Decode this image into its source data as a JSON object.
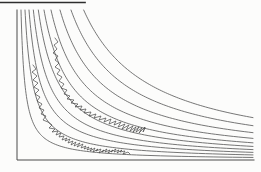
{
  "figure": {
    "background_color": "#fcfcfb",
    "curve_color": "#5d5d5d",
    "axis_color": "#4a4a4a",
    "trace_color": "#454545",
    "rule_color": "#2e2e2e"
  },
  "chart_data": {
    "type": "line",
    "title": "",
    "xlabel": "",
    "ylabel": "",
    "grid": false,
    "legend": null,
    "plot_box_px": {
      "left": 17,
      "top": 10,
      "right": 253,
      "bottom": 160
    },
    "top_rule_px": {
      "x1": 0,
      "y": 2.5,
      "x2": 85
    },
    "axis_ranges_units": {
      "x": [
        0,
        236
      ],
      "y": [
        0,
        150
      ]
    },
    "hyperbolas": {
      "model": "y = k / x in plot units (origin at axes corner, y upward), clipped to y <= 150 and x <= 236",
      "k_values": [
        600,
        1200,
        1800,
        2450,
        3200,
        4050,
        5100,
        6450,
        8100,
        10000
      ]
    },
    "series": [
      {
        "name": "random-walk-upper",
        "points": [
          [
            38,
            122
          ],
          [
            41,
            118
          ],
          [
            37,
            115
          ],
          [
            40,
            111
          ],
          [
            36,
            107
          ],
          [
            41,
            104
          ],
          [
            38,
            100
          ],
          [
            42,
            97
          ],
          [
            38,
            93
          ],
          [
            43,
            90
          ],
          [
            40,
            86
          ],
          [
            45,
            83
          ],
          [
            42,
            79
          ],
          [
            47,
            76
          ],
          [
            44,
            72
          ],
          [
            50,
            70
          ],
          [
            47,
            66
          ],
          [
            53,
            64
          ],
          [
            50,
            61
          ],
          [
            57,
            60
          ],
          [
            54,
            57
          ],
          [
            61,
            56
          ],
          [
            58,
            53
          ],
          [
            65,
            54
          ],
          [
            63,
            50
          ],
          [
            69,
            51
          ],
          [
            67,
            47
          ],
          [
            74,
            48
          ],
          [
            72,
            44
          ],
          [
            79,
            46
          ],
          [
            77,
            42
          ],
          [
            84,
            44
          ],
          [
            82,
            40
          ],
          [
            89,
            42
          ],
          [
            87,
            38
          ],
          [
            94,
            41
          ],
          [
            92,
            36
          ],
          [
            99,
            39
          ],
          [
            97,
            35
          ],
          [
            104,
            38
          ],
          [
            101,
            33
          ],
          [
            108,
            36
          ],
          [
            105,
            31
          ],
          [
            112,
            35
          ],
          [
            109,
            30
          ],
          [
            116,
            34
          ],
          [
            113,
            29
          ],
          [
            119,
            33
          ],
          [
            116,
            28
          ],
          [
            122,
            33
          ],
          [
            119,
            28
          ],
          [
            125,
            32
          ],
          [
            122,
            27
          ],
          [
            128,
            33
          ],
          [
            126,
            28
          ],
          [
            128,
            32
          ]
        ]
      },
      {
        "name": "random-walk-lower",
        "points": [
          [
            16,
            95
          ],
          [
            19,
            91
          ],
          [
            15,
            88
          ],
          [
            20,
            84
          ],
          [
            16,
            80
          ],
          [
            21,
            77
          ],
          [
            17,
            73
          ],
          [
            22,
            70
          ],
          [
            18,
            66
          ],
          [
            23,
            63
          ],
          [
            20,
            59
          ],
          [
            25,
            56
          ],
          [
            22,
            52
          ],
          [
            27,
            50
          ],
          [
            24,
            46
          ],
          [
            29,
            44
          ],
          [
            26,
            40
          ],
          [
            31,
            38
          ],
          [
            35,
            35
          ],
          [
            32,
            32
          ],
          [
            38,
            31
          ],
          [
            35,
            28
          ],
          [
            41,
            29
          ],
          [
            39,
            25
          ],
          [
            44,
            27
          ],
          [
            42,
            23
          ],
          [
            47,
            24
          ],
          [
            45,
            20
          ],
          [
            50,
            22
          ],
          [
            48,
            19
          ],
          [
            53,
            21
          ],
          [
            51,
            17
          ],
          [
            56,
            19
          ],
          [
            54,
            15
          ],
          [
            59,
            18
          ],
          [
            57,
            14
          ],
          [
            63,
            17
          ],
          [
            60,
            13
          ],
          [
            66,
            16
          ],
          [
            64,
            12
          ],
          [
            69,
            14
          ],
          [
            67,
            11
          ],
          [
            72,
            13
          ],
          [
            70,
            10
          ],
          [
            75,
            12
          ],
          [
            73,
            9
          ],
          [
            78,
            12
          ],
          [
            76,
            8
          ],
          [
            81,
            11
          ],
          [
            79,
            9
          ],
          [
            84,
            11
          ],
          [
            82,
            7
          ],
          [
            87,
            10
          ],
          [
            85,
            8
          ],
          [
            90,
            11
          ],
          [
            88,
            8
          ],
          [
            93,
            10
          ],
          [
            91,
            7
          ],
          [
            96,
            10
          ],
          [
            94,
            8
          ],
          [
            99,
            11
          ],
          [
            97,
            8
          ],
          [
            102,
            10
          ],
          [
            100,
            7
          ],
          [
            105,
            10
          ],
          [
            103,
            8
          ],
          [
            108,
            9
          ],
          [
            106,
            6
          ],
          [
            111,
            8
          ],
          [
            113,
            6
          ]
        ]
      }
    ]
  }
}
